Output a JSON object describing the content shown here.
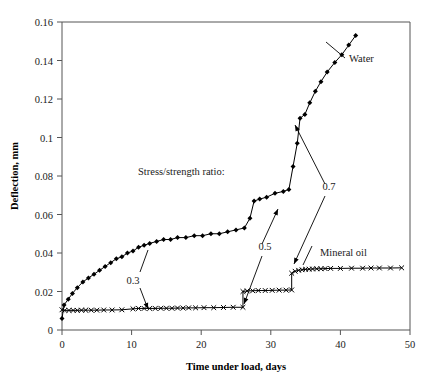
{
  "chart_data": {
    "type": "line",
    "title": "",
    "xlabel": "Time under load, days",
    "ylabel": "Deflection, mm",
    "xlim": [
      0,
      50
    ],
    "ylim": [
      0,
      0.16
    ],
    "xticks": [
      0,
      10,
      20,
      30,
      40,
      50
    ],
    "xticklabels": [
      "0",
      "10",
      "20",
      "30",
      "40",
      "50"
    ],
    "yticks": [
      0,
      0.02,
      0.04,
      0.06,
      0.08,
      0.1,
      0.12,
      0.14,
      0.16
    ],
    "yticklabels": [
      "0",
      "0.02",
      "0.04",
      "0.06",
      "0.08",
      "0.1",
      "0.12",
      "0.14",
      "0.16"
    ],
    "grid": false,
    "legend_position": "inline-annotations",
    "series": [
      {
        "name": "Water",
        "marker": "filled-diamond",
        "points": [
          [
            0.0,
            0.006
          ],
          [
            0.3,
            0.013
          ],
          [
            0.9,
            0.016
          ],
          [
            1.5,
            0.019
          ],
          [
            2.2,
            0.022
          ],
          [
            3.0,
            0.025
          ],
          [
            3.8,
            0.027
          ],
          [
            4.6,
            0.029
          ],
          [
            5.4,
            0.031
          ],
          [
            6.2,
            0.033
          ],
          [
            7.0,
            0.035
          ],
          [
            7.8,
            0.037
          ],
          [
            8.6,
            0.038
          ],
          [
            9.4,
            0.04
          ],
          [
            10.2,
            0.041
          ],
          [
            11.0,
            0.043
          ],
          [
            11.8,
            0.044
          ],
          [
            12.6,
            0.045
          ],
          [
            13.6,
            0.046
          ],
          [
            14.6,
            0.047
          ],
          [
            15.6,
            0.047
          ],
          [
            16.6,
            0.048
          ],
          [
            17.8,
            0.048
          ],
          [
            19.0,
            0.049
          ],
          [
            20.2,
            0.049
          ],
          [
            21.4,
            0.05
          ],
          [
            22.6,
            0.05
          ],
          [
            23.8,
            0.051
          ],
          [
            25.0,
            0.052
          ],
          [
            26.2,
            0.053
          ],
          [
            27.0,
            0.058
          ],
          [
            27.6,
            0.067
          ],
          [
            28.4,
            0.068
          ],
          [
            29.4,
            0.069
          ],
          [
            30.6,
            0.071
          ],
          [
            31.8,
            0.072
          ],
          [
            32.6,
            0.073
          ],
          [
            33.2,
            0.085
          ],
          [
            33.8,
            0.097
          ],
          [
            34.2,
            0.11
          ],
          [
            34.9,
            0.112
          ],
          [
            35.6,
            0.118
          ],
          [
            36.4,
            0.124
          ],
          [
            37.2,
            0.129
          ],
          [
            38.1,
            0.134
          ],
          [
            39.2,
            0.139
          ],
          [
            40.2,
            0.143
          ],
          [
            41.2,
            0.148
          ],
          [
            42.2,
            0.153
          ]
        ]
      },
      {
        "name": "Mineral oil",
        "marker": "x",
        "points": [
          [
            0.0,
            0.0105
          ],
          [
            0.4,
            0.0102
          ],
          [
            1.0,
            0.0102
          ],
          [
            1.6,
            0.0102
          ],
          [
            2.2,
            0.0102
          ],
          [
            2.8,
            0.0103
          ],
          [
            3.4,
            0.0103
          ],
          [
            4.2,
            0.0103
          ],
          [
            5.0,
            0.0103
          ],
          [
            6.0,
            0.0104
          ],
          [
            7.2,
            0.0104
          ],
          [
            8.6,
            0.0105
          ],
          [
            10.2,
            0.011
          ],
          [
            11.0,
            0.0112
          ],
          [
            11.8,
            0.0112
          ],
          [
            12.6,
            0.0112
          ],
          [
            13.4,
            0.0112
          ],
          [
            14.2,
            0.0113
          ],
          [
            15.0,
            0.0113
          ],
          [
            15.8,
            0.0113
          ],
          [
            16.6,
            0.0114
          ],
          [
            17.4,
            0.0114
          ],
          [
            18.2,
            0.0115
          ],
          [
            19.2,
            0.0115
          ],
          [
            20.4,
            0.0116
          ],
          [
            21.8,
            0.0116
          ],
          [
            23.2,
            0.0117
          ],
          [
            24.6,
            0.0118
          ],
          [
            26.0,
            0.0118
          ],
          [
            26.0,
            0.02
          ],
          [
            26.6,
            0.0203
          ],
          [
            27.4,
            0.0204
          ],
          [
            28.2,
            0.0205
          ],
          [
            29.2,
            0.0205
          ],
          [
            30.2,
            0.0206
          ],
          [
            31.2,
            0.0207
          ],
          [
            32.2,
            0.0207
          ],
          [
            33.0,
            0.0208
          ],
          [
            33.0,
            0.0295
          ],
          [
            33.5,
            0.0305
          ],
          [
            34.0,
            0.031
          ],
          [
            34.5,
            0.0313
          ],
          [
            35.0,
            0.0315
          ],
          [
            35.5,
            0.0316
          ],
          [
            36.0,
            0.0317
          ],
          [
            36.6,
            0.0318
          ],
          [
            37.2,
            0.0318
          ],
          [
            37.8,
            0.0319
          ],
          [
            38.6,
            0.032
          ],
          [
            40.0,
            0.032
          ],
          [
            41.6,
            0.0321
          ],
          [
            43.2,
            0.0321
          ],
          [
            44.4,
            0.0322
          ],
          [
            45.6,
            0.0322
          ],
          [
            47.2,
            0.0322
          ],
          [
            48.8,
            0.0323
          ]
        ]
      }
    ],
    "annotations": [
      {
        "text": "Stress/strength ratio:",
        "x_px": 138,
        "y_px": 175,
        "anchor": "start",
        "kind": "caption"
      },
      {
        "text": "0.3",
        "x_px": 133,
        "y_px": 284,
        "anchor": "middle",
        "kind": "ratio-label",
        "leader_from": [
          140,
          288
        ],
        "leader_to": [
          148,
          309
        ]
      },
      {
        "text": "0.5",
        "x_px": 265,
        "y_px": 250,
        "anchor": "middle",
        "kind": "ratio-label",
        "leader_from": [
          262,
          256
        ],
        "leader_to": [
          244,
          304
        ]
      },
      {
        "text": "0.7",
        "x_px": 329,
        "y_px": 190,
        "anchor": "middle",
        "kind": "ratio-label",
        "leader_from": [
          325,
          196
        ],
        "leader_to": [
          294,
          264
        ]
      }
    ],
    "series_labels": [
      {
        "text": "Water",
        "x_px": 349,
        "y_px": 62,
        "anchor": "start",
        "leader_from": [
          345,
          58
        ],
        "leader_to": [
          326,
          42
        ]
      },
      {
        "text": "Mineral oil",
        "x_px": 320,
        "y_px": 256,
        "anchor": "start",
        "leader_from": [
          312,
          246
        ],
        "leader_to": [
          303,
          265
        ]
      }
    ],
    "pointer_leaders": [
      {
        "name": "ratio-03-upper-stem",
        "from": [
          140,
          272
        ],
        "to": [
          148,
          250
        ]
      },
      {
        "name": "ratio-05-upper-stem",
        "from": [
          262,
          244
        ],
        "to": [
          278,
          209
        ]
      },
      {
        "name": "ratio-07-upper-stem",
        "from": [
          325,
          184
        ],
        "to": [
          295,
          125
        ]
      }
    ]
  },
  "colors": {
    "series_line": "#000000",
    "frame": "#555555",
    "text": "#1a1a1a",
    "background": "#ffffff"
  }
}
